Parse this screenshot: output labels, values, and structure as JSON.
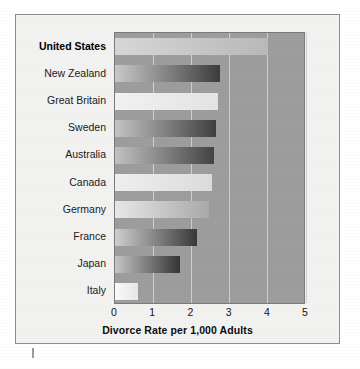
{
  "chart_data": {
    "type": "bar",
    "orientation": "horizontal",
    "title": "",
    "xlabel": "Divorce Rate per 1,000 Adults",
    "ylabel": "",
    "xlim": [
      0,
      5
    ],
    "xticks": [
      0,
      1,
      2,
      3,
      4,
      5
    ],
    "xtick_labels": [
      "0",
      "1",
      "2",
      "3",
      "4",
      "5"
    ],
    "grid": true,
    "grid_axis": "x",
    "legend": "none",
    "categories": [
      "United States",
      "New Zealand",
      "Great Britain",
      "Sweden",
      "Australia",
      "Canada",
      "Germany",
      "France",
      "Japan",
      "Italy"
    ],
    "values": [
      4.0,
      2.75,
      2.7,
      2.65,
      2.6,
      2.55,
      2.45,
      2.15,
      1.7,
      0.6
    ],
    "highlight_category": "United States",
    "bars": [
      {
        "label": "United States",
        "value": 4.0,
        "emphasis": true,
        "fill_from": "#d7d7d7",
        "fill_to": "#b9b9b9"
      },
      {
        "label": "New Zealand",
        "value": 2.75,
        "emphasis": false,
        "fill_from": "#c9c9c9",
        "fill_to": "#3c3c3c"
      },
      {
        "label": "Great Britain",
        "value": 2.7,
        "emphasis": false,
        "fill_from": "#f2f2f2",
        "fill_to": "#e4e4e4"
      },
      {
        "label": "Sweden",
        "value": 2.65,
        "emphasis": false,
        "fill_from": "#c4c4c4",
        "fill_to": "#3f3f3f"
      },
      {
        "label": "Australia",
        "value": 2.6,
        "emphasis": false,
        "fill_from": "#c2c2c2",
        "fill_to": "#434343"
      },
      {
        "label": "Canada",
        "value": 2.55,
        "emphasis": false,
        "fill_from": "#efefef",
        "fill_to": "#dcdcdc"
      },
      {
        "label": "Germany",
        "value": 2.45,
        "emphasis": false,
        "fill_from": "#e8e8e8",
        "fill_to": "#a9a9a9"
      },
      {
        "label": "France",
        "value": 2.15,
        "emphasis": false,
        "fill_from": "#cfcfcf",
        "fill_to": "#383838"
      },
      {
        "label": "Japan",
        "value": 1.7,
        "emphasis": false,
        "fill_from": "#c6c6c6",
        "fill_to": "#343434"
      },
      {
        "label": "Italy",
        "value": 0.6,
        "emphasis": false,
        "fill_from": "#fafafa",
        "fill_to": "#e8e8e8"
      }
    ]
  },
  "colors": {
    "plot_background": "#9d9d9d",
    "figure_background": "#f2f2f1",
    "page_background": "#ffffff",
    "gridline": "#cfcfcf",
    "frame_border": "#8b8b8b",
    "plot_border": "#7a7a7a",
    "text": "#1a1a1a"
  }
}
